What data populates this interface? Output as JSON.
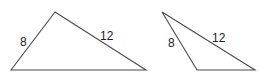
{
  "figure": {
    "line_color": "#4a4a4a",
    "text_color": "#222222",
    "triangles": [
      {
        "id": "triangle-1",
        "vertices": [
          [
            11,
            70
          ],
          [
            55,
            12
          ],
          [
            146,
            70
          ]
        ],
        "labels": [
          {
            "text": "8",
            "x": 20,
            "y": 46
          },
          {
            "text": "12",
            "x": 100,
            "y": 40
          }
        ]
      },
      {
        "id": "triangle-2",
        "vertices": [
          [
            162,
            12
          ],
          [
            197,
            70
          ],
          [
            255,
            70
          ]
        ],
        "labels": [
          {
            "text": "8",
            "x": 168,
            "y": 47
          },
          {
            "text": "12",
            "x": 212,
            "y": 42
          }
        ]
      }
    ]
  }
}
